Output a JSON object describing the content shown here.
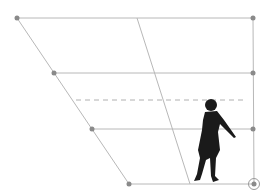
{
  "diagram": {
    "type": "perspective-grid",
    "colors": {
      "line": "#b8b8b8",
      "point": "#8a8a8a",
      "dashed": "#b0b0b0",
      "figure": "#1a1a1a"
    },
    "quad": {
      "top_left": [
        17,
        18
      ],
      "top_right": [
        253,
        18
      ],
      "bottom_right": [
        254,
        184
      ],
      "bottom_left": [
        129,
        184
      ]
    },
    "horizontal_lines_y": [
      73,
      129
    ],
    "horizon_dashed_y": 100,
    "points": [
      {
        "name": "top-left",
        "x": 17,
        "y": 18
      },
      {
        "name": "mid-left-1",
        "x": 54,
        "y": 73
      },
      {
        "name": "mid-left-2",
        "x": 92,
        "y": 129
      },
      {
        "name": "bottom-left",
        "x": 129,
        "y": 184
      },
      {
        "name": "top-right",
        "x": 253,
        "y": 18
      },
      {
        "name": "mid-right-1",
        "x": 253,
        "y": 73
      },
      {
        "name": "mid-right-2",
        "x": 253,
        "y": 129
      }
    ],
    "selected_point": {
      "name": "bottom-right",
      "x": 254,
      "y": 184
    },
    "diagonal_line": {
      "x1": 137,
      "y1": 18,
      "x2": 190,
      "y2": 184
    },
    "figure": {
      "label": "human-silhouette"
    }
  }
}
